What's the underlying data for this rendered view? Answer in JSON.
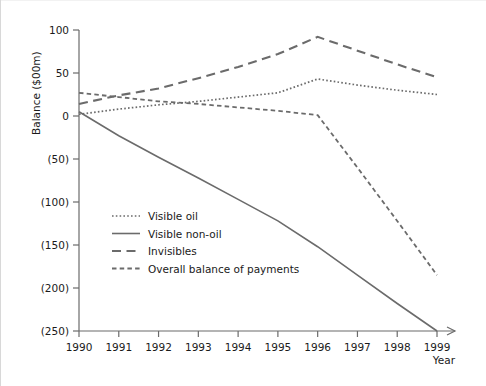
{
  "chart_data": {
    "type": "line",
    "title": "",
    "xlabel": "Year",
    "ylabel": "Balance ($00m)",
    "x": [
      1990,
      1991,
      1992,
      1993,
      1994,
      1995,
      1996,
      1997,
      1998,
      1999
    ],
    "categories": [
      "1990",
      "1991",
      "1992",
      "1993",
      "1994",
      "1995",
      "1996",
      "1997",
      "1998",
      "1999"
    ],
    "xlim": [
      1990,
      1999
    ],
    "ylim": [
      -250,
      100
    ],
    "yticks": [
      100,
      50,
      0,
      -50,
      -100,
      -150,
      -200,
      -250
    ],
    "ytick_labels": [
      "100",
      "50",
      "0",
      "(50)",
      "(100)",
      "(150)",
      "(200)",
      "(250)"
    ],
    "grid": false,
    "legend_position": "inside-lower-left",
    "series": [
      {
        "name": "Visible oil",
        "style": "dotted",
        "values": [
          2,
          8,
          13,
          17,
          22,
          27,
          43,
          36,
          30,
          25
        ]
      },
      {
        "name": "Visible non-oil",
        "style": "solid",
        "values": [
          5,
          -23,
          -48,
          -72,
          -97,
          -122,
          -152,
          -185,
          -218,
          -250
        ]
      },
      {
        "name": "Invisibles",
        "style": "long-dash",
        "values": [
          14,
          24,
          32,
          44,
          57,
          72,
          92,
          76,
          60,
          45
        ]
      },
      {
        "name": "Overall balance of payments",
        "style": "short-dash",
        "values": [
          27,
          22,
          17,
          14,
          10,
          6,
          1,
          -60,
          -122,
          -185
        ]
      }
    ]
  },
  "axes": {
    "y_title": "Balance ($00m)",
    "x_title": "Year"
  },
  "legend": {
    "items": [
      {
        "label": "Visible oil",
        "style": "dotted"
      },
      {
        "label": "Visible non-oil",
        "style": "solid"
      },
      {
        "label": "Invisibles",
        "style": "long-dash"
      },
      {
        "label": "Overall balance of payments",
        "style": "short-dash"
      }
    ]
  },
  "colors": {
    "line": "#6b6b6b",
    "text": "#1a1a1a",
    "background": "#ffffff"
  }
}
